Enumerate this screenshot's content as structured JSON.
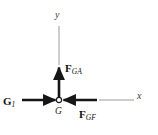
{
  "figure": {
    "type": "free-body-diagram",
    "colors": {
      "vector": "#161616",
      "axis": "#9a9a9a",
      "text": "#111111",
      "node_fill": "#ffffff",
      "node_stroke": "#1a1a1a",
      "background": "#ffffff"
    },
    "origin": {
      "name": "G",
      "label": "G",
      "marker": "open-circle",
      "x": 59,
      "y": 100
    },
    "axes": [
      {
        "id": "y-axis",
        "label": "y",
        "direction": "up",
        "style": "thin-line",
        "from": [
          59,
          65
        ],
        "to": [
          59,
          26
        ]
      },
      {
        "id": "x-axis",
        "label": "x",
        "direction": "right",
        "style": "thin-line",
        "from": [
          99,
          100
        ],
        "to": [
          134,
          100
        ]
      }
    ],
    "vectors": [
      {
        "id": "vector-G1",
        "name": "G",
        "subscript": "1",
        "label": "G_1",
        "direction": "right",
        "from": [
          22,
          100
        ],
        "to": [
          57,
          100
        ]
      },
      {
        "id": "vector-FGA",
        "name": "F",
        "subscript": "GA",
        "label": "F_GA",
        "direction": "up",
        "from": [
          59,
          98
        ],
        "to": [
          59,
          66
        ]
      },
      {
        "id": "vector-FGF",
        "name": "F",
        "subscript": "GF",
        "label": "F_GF",
        "direction": "left",
        "from": [
          97,
          100
        ],
        "to": [
          62,
          100
        ]
      }
    ]
  }
}
